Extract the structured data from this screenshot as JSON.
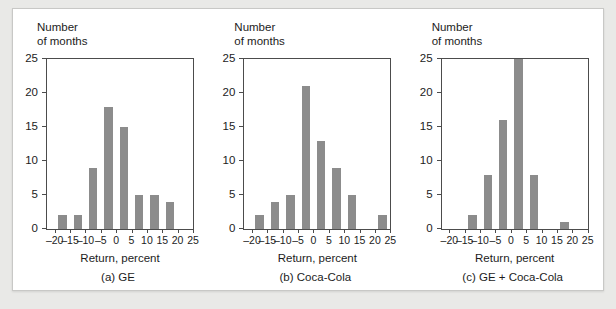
{
  "figure": {
    "background_color": "#ffffff",
    "page_background_color": "#e9e9e7",
    "bar_color": "#8c8c8c",
    "axis_color": "#4c4c4c",
    "text_color": "#1c1c1c"
  },
  "axis": {
    "ylabel_line1": "Number",
    "ylabel_line2": "of months",
    "xlabel": "Return, percent",
    "yticks": [
      0,
      5,
      10,
      15,
      20,
      25
    ],
    "ytick_labels": [
      "0",
      "5",
      "10",
      "15",
      "20",
      "25"
    ],
    "xticks": [
      -20,
      -15,
      -10,
      -5,
      0,
      5,
      10,
      15,
      20,
      25
    ],
    "xtick_labels": [
      "–20",
      "–15",
      "–10",
      "–5",
      "0",
      "5",
      "10",
      "15",
      "20",
      "25"
    ],
    "ylim": [
      0,
      25
    ],
    "xlim": [
      -22.5,
      25
    ]
  },
  "captions": {
    "a": "(a) GE",
    "b": "(b) Coca-Cola",
    "c": "(c) GE + Coca-Cola"
  },
  "chart_data": [
    {
      "type": "bar",
      "title": "(a) GE",
      "xlabel": "Return, percent",
      "ylabel": "Number of months",
      "xlim": [
        -22.5,
        25
      ],
      "ylim": [
        0,
        25
      ],
      "grid": false,
      "legend": "none",
      "bin_width": 5,
      "bin_starts": [
        -20,
        -15,
        -10,
        -5,
        0,
        5,
        10,
        15
      ],
      "bin_labels": [
        "–20 to –15",
        "–15 to –10",
        "–10 to –5",
        "–5 to 0",
        "0 to 5",
        "5 to 10",
        "10 to 15",
        "15 to 20"
      ],
      "values": [
        2,
        2,
        9,
        18,
        15,
        5,
        5,
        4
      ]
    },
    {
      "type": "bar",
      "title": "(b) Coca-Cola",
      "xlabel": "Return, percent",
      "ylabel": "Number of months",
      "xlim": [
        -22.5,
        25
      ],
      "ylim": [
        0,
        25
      ],
      "grid": false,
      "legend": "none",
      "bin_width": 5,
      "bin_starts": [
        -20,
        -15,
        -10,
        -5,
        0,
        5,
        10,
        15,
        20
      ],
      "bin_labels": [
        "–20 to –15",
        "–15 to –10",
        "–10 to –5",
        "–5 to 0",
        "0 to 5",
        "5 to 10",
        "10 to 15",
        "15 to 20",
        "20 to 25"
      ],
      "values": [
        2,
        4,
        5,
        21,
        13,
        9,
        5,
        0,
        2
      ]
    },
    {
      "type": "bar",
      "title": "(c) GE + Coca-Cola",
      "xlabel": "Return, percent",
      "ylabel": "Number of months",
      "xlim": [
        -22.5,
        25
      ],
      "ylim": [
        0,
        25
      ],
      "grid": false,
      "legend": "none",
      "bin_width": 5,
      "bin_starts": [
        -20,
        -15,
        -10,
        -5,
        0,
        5,
        10,
        15
      ],
      "bin_labels": [
        "–20 to –15",
        "–15 to –10",
        "–10 to –5",
        "–5 to 0",
        "0 to 5",
        "5 to 10",
        "10 to 15",
        "15 to 20"
      ],
      "values": [
        0,
        2,
        8,
        16,
        25,
        8,
        0,
        1
      ]
    }
  ]
}
